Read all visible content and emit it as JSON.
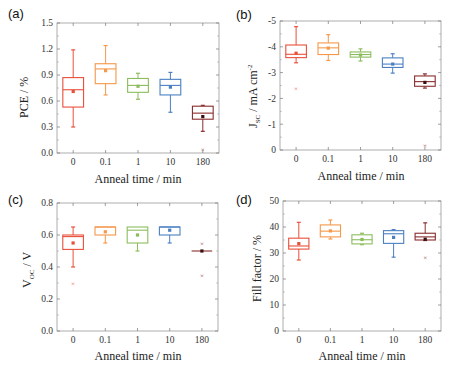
{
  "colors": [
    "#e8503a",
    "#f5984a",
    "#8cbd5c",
    "#4a80c2",
    "#8a2d2d"
  ],
  "chart_data": [
    {
      "type": "box",
      "panel": "(a)",
      "title": "",
      "xlabel": "Anneal time / min",
      "ylabel": "PCE / %",
      "categories": [
        "0",
        "0.1",
        "1",
        "10",
        "180"
      ],
      "yticks": [
        "0.0",
        "0.3",
        "0.6",
        "0.9",
        "1.2",
        "1.5"
      ],
      "ylim": [
        0,
        1.5
      ],
      "inverted_labels": false,
      "boxes": [
        {
          "min": 0.3,
          "q1": 0.53,
          "median": 0.73,
          "q3": 0.87,
          "max": 1.19,
          "mean": 0.71,
          "outliers": []
        },
        {
          "min": 0.67,
          "q1": 0.8,
          "median": 0.97,
          "q3": 1.03,
          "max": 1.24,
          "mean": 0.95,
          "outliers": []
        },
        {
          "min": 0.62,
          "q1": 0.7,
          "median": 0.78,
          "q3": 0.86,
          "max": 0.92,
          "mean": 0.77,
          "outliers": []
        },
        {
          "min": 0.47,
          "q1": 0.67,
          "median": 0.78,
          "q3": 0.85,
          "max": 0.93,
          "mean": 0.76,
          "outliers": []
        },
        {
          "min": 0.25,
          "q1": 0.39,
          "median": 0.46,
          "q3": 0.54,
          "max": 0.55,
          "mean": 0.42,
          "outliers": [
            0.04
          ]
        }
      ]
    },
    {
      "type": "box",
      "panel": "(b)",
      "title": "",
      "xlabel": "Anneal time / min",
      "ylabel": "J_SC / mA cm^-2",
      "ylabel_main": "J",
      "ylabel_sub": "SC",
      "ylabel_rest": " / mA cm",
      "ylabel_sup": "-2",
      "categories": [
        "0",
        "0.1",
        "1",
        "10",
        "180"
      ],
      "yticks": [
        "0",
        "-1",
        "-2",
        "-3",
        "-4",
        "-5"
      ],
      "ylim": [
        0,
        -5
      ],
      "inverted_labels": true,
      "boxes": [
        {
          "min": 3.38,
          "q1": 3.58,
          "median": 3.71,
          "q3": 4.07,
          "max": 4.78,
          "mean": 3.75,
          "outliers": [
            2.38
          ]
        },
        {
          "min": 3.47,
          "q1": 3.7,
          "median": 3.96,
          "q3": 4.15,
          "max": 4.47,
          "mean": 3.95,
          "outliers": []
        },
        {
          "min": 3.45,
          "q1": 3.6,
          "median": 3.7,
          "q3": 3.8,
          "max": 3.92,
          "mean": 3.68,
          "outliers": []
        },
        {
          "min": 2.98,
          "q1": 3.2,
          "median": 3.33,
          "q3": 3.57,
          "max": 3.73,
          "mean": 3.33,
          "outliers": []
        },
        {
          "min": 2.4,
          "q1": 2.47,
          "median": 2.65,
          "q3": 2.87,
          "max": 2.95,
          "mean": 2.62,
          "outliers": [
            0.18
          ]
        }
      ]
    },
    {
      "type": "box",
      "panel": "(c)",
      "title": "",
      "xlabel": "Anneal time / min",
      "ylabel": "V_OC / V",
      "ylabel_main": "V",
      "ylabel_sub": "OC",
      "ylabel_rest": " / V",
      "categories": [
        "0",
        "0.1",
        "1",
        "10",
        "180"
      ],
      "yticks": [
        "0.0",
        "0.2",
        "0.4",
        "0.6",
        "0.8"
      ],
      "ylim": [
        0,
        0.8
      ],
      "inverted_labels": false,
      "boxes": [
        {
          "min": 0.4,
          "q1": 0.51,
          "median": 0.59,
          "q3": 0.6,
          "max": 0.65,
          "mean": 0.55,
          "outliers": [
            0.3
          ]
        },
        {
          "min": 0.55,
          "q1": 0.6,
          "median": 0.65,
          "q3": 0.65,
          "max": 0.65,
          "mean": 0.62,
          "outliers": []
        },
        {
          "min": 0.5,
          "q1": 0.55,
          "median": 0.63,
          "q3": 0.65,
          "max": 0.65,
          "mean": 0.6,
          "outliers": []
        },
        {
          "min": 0.55,
          "q1": 0.6,
          "median": 0.65,
          "q3": 0.65,
          "max": 0.65,
          "mean": 0.63,
          "outliers": []
        },
        {
          "min": 0.5,
          "q1": 0.5,
          "median": 0.5,
          "q3": 0.5,
          "max": 0.5,
          "mean": 0.5,
          "outliers": [
            0.55,
            0.35
          ]
        }
      ]
    },
    {
      "type": "box",
      "panel": "(d)",
      "title": "",
      "xlabel": "Anneal time / min",
      "ylabel": "Fill factor / %",
      "categories": [
        "0",
        "0.1",
        "1",
        "10",
        "180"
      ],
      "yticks": [
        "0",
        "10",
        "20",
        "30",
        "40",
        "50"
      ],
      "ylim": [
        0,
        50
      ],
      "inverted_labels": false,
      "boxes": [
        {
          "min": 27.3,
          "q1": 31.5,
          "median": 32.7,
          "q3": 35.7,
          "max": 41.8,
          "mean": 33.6,
          "outliers": []
        },
        {
          "min": 35.4,
          "q1": 36.2,
          "median": 38.4,
          "q3": 40.8,
          "max": 42.7,
          "mean": 38.5,
          "outliers": []
        },
        {
          "min": 33.2,
          "q1": 33.5,
          "median": 35.1,
          "q3": 37.0,
          "max": 37.6,
          "mean": 35.2,
          "outliers": []
        },
        {
          "min": 28.4,
          "q1": 33.7,
          "median": 37.4,
          "q3": 38.6,
          "max": 39.0,
          "mean": 36.0,
          "outliers": []
        },
        {
          "min": 34.8,
          "q1": 35.0,
          "median": 36.2,
          "q3": 37.6,
          "max": 41.6,
          "mean": 35.3,
          "outliers": [
            28.2
          ]
        }
      ]
    }
  ],
  "panels": {
    "a": {
      "label": "(a)",
      "ylabel": "PCE / %",
      "xlabel": "Anneal time / min"
    },
    "b": {
      "label": "(b)",
      "ylabel_main": "J",
      "ylabel_sub": "SC",
      "ylabel_rest": " / mA cm",
      "ylabel_sup": "-2",
      "xlabel": "Anneal time / min"
    },
    "c": {
      "label": "(c)",
      "ylabel_main": "V",
      "ylabel_sub": "OC",
      "ylabel_rest": " / V",
      "xlabel": "Anneal time / min"
    },
    "d": {
      "label": "(d)",
      "ylabel": "Fill factor / %",
      "xlabel": "Anneal time / min"
    }
  }
}
